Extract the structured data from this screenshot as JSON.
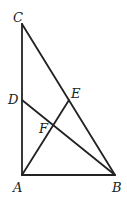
{
  "diagram": {
    "points": {
      "A": {
        "label": "A",
        "x": 22,
        "y": 175
      },
      "B": {
        "label": "B",
        "x": 115,
        "y": 175
      },
      "C": {
        "label": "C",
        "x": 22,
        "y": 24
      },
      "D": {
        "label": "D",
        "x": 22,
        "y": 100
      },
      "E": {
        "label": "E",
        "x": 69,
        "y": 100
      },
      "F": {
        "label": "F",
        "x": 53,
        "y": 125
      }
    },
    "segments": [
      "AC",
      "AB",
      "CB",
      "DB",
      "AE"
    ]
  }
}
